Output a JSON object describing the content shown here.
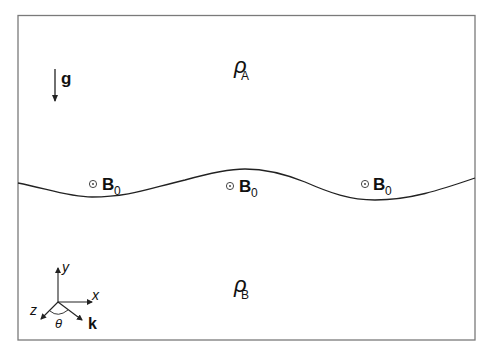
{
  "figure": {
    "type": "schematic",
    "colors": {
      "frame": "#7a7a7a",
      "line": "#222222",
      "text": "#111111",
      "background": "#ffffff"
    }
  },
  "regions": {
    "upper": {
      "symbol": "ρ",
      "subscript": "A"
    },
    "lower": {
      "symbol": "ρ",
      "subscript": "B"
    }
  },
  "gravity": {
    "label": "g",
    "direction": "down"
  },
  "magnetic_field": {
    "markers": [
      {
        "symbol": "⊙",
        "label": "B",
        "subscript": "0"
      },
      {
        "symbol": "⊙",
        "label": "B",
        "subscript": "0"
      },
      {
        "symbol": "⊙",
        "label": "B",
        "subscript": "0"
      }
    ],
    "direction": "out of page"
  },
  "axes": {
    "x_label": "x",
    "y_label": "y",
    "z_label": "z",
    "k_label": "k",
    "angle_label": "θ"
  }
}
